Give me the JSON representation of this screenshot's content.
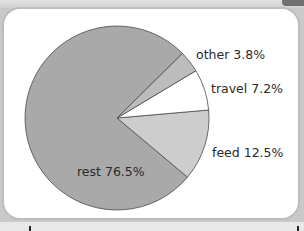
{
  "chart_data": {
    "type": "pie",
    "title": "",
    "categories": [
      "rest",
      "feed",
      "travel",
      "other"
    ],
    "values": [
      76.5,
      12.5,
      7.2,
      3.8
    ],
    "unit": "%",
    "labels": [
      "rest 76.5%",
      "feed 12.5%",
      "travel 7.2%",
      "other 3.8%"
    ],
    "colors": {
      "rest": "#a9a9a9",
      "feed": "#cdcdcd",
      "travel": "#ffffff",
      "other": "#bcbcbc"
    },
    "legend": "none (labels placed next to slices)",
    "start_angle_deg": -5,
    "direction": "feed clockwise from start; travel, other, rest counter-clockwise"
  },
  "labels": {
    "rest": "rest 76.5%",
    "feed": "feed 12.5%",
    "travel": "travel 7.2%",
    "other": "other 3.8%"
  }
}
